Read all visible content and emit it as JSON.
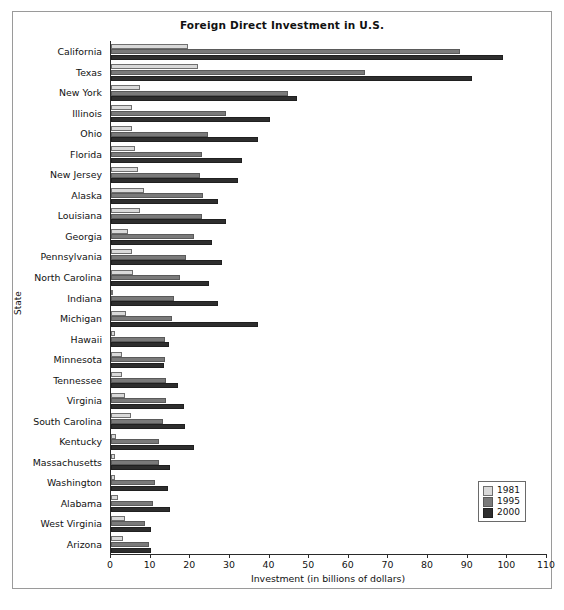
{
  "chart_data": {
    "type": "bar",
    "orientation": "horizontal",
    "title": "Foreign Direct Investment in U.S.",
    "xlabel": "Investment (in billions of dollars)",
    "ylabel": "State",
    "xlim": [
      0,
      110
    ],
    "xticks": [
      0,
      10,
      20,
      30,
      40,
      50,
      60,
      70,
      80,
      90,
      100,
      110
    ],
    "grid": false,
    "legend_position": "bottom-right",
    "categories": [
      "California",
      "Texas",
      "New York",
      "Illinois",
      "Ohio",
      "Florida",
      "New Jersey",
      "Alaska",
      "Louisiana",
      "Georgia",
      "Pennsylvania",
      "North Carolina",
      "Indiana",
      "Michigan",
      "Hawaii",
      "Minnesota",
      "Tennessee",
      "Virginia",
      "South Carolina",
      "Kentucky",
      "Massachusetts",
      "Washington",
      "Alabama",
      "West Virginia",
      "Arizona"
    ],
    "series": [
      {
        "name": "1981",
        "color": "#d9d9d9",
        "values": [
          19.5,
          22.0,
          7.3,
          5.3,
          5.3,
          6.0,
          6.8,
          8.4,
          7.4,
          4.2,
          5.4,
          5.5,
          0.3,
          3.8,
          1.0,
          2.8,
          2.8,
          3.5,
          5.0,
          1.3,
          1.0,
          1.0,
          1.7,
          3.5,
          3.0
        ]
      },
      {
        "name": "1995",
        "color": "#7a7a7a",
        "values": [
          88.0,
          64.0,
          44.7,
          29.0,
          24.5,
          23.0,
          22.5,
          23.3,
          23.0,
          21.0,
          19.0,
          17.4,
          15.8,
          15.5,
          13.5,
          13.6,
          14.0,
          14.0,
          13.0,
          12.0,
          12.0,
          11.0,
          10.5,
          8.5,
          9.5
        ]
      },
      {
        "name": "2000",
        "color": "#2e2e2e",
        "values": [
          99.0,
          91.0,
          47.0,
          40.0,
          37.0,
          33.0,
          32.0,
          27.0,
          29.0,
          25.5,
          28.0,
          24.8,
          27.0,
          37.0,
          14.7,
          13.3,
          17.0,
          18.4,
          18.7,
          21.0,
          15.0,
          14.5,
          15.0,
          10.0,
          10.0
        ]
      }
    ]
  },
  "legend": {
    "items": [
      {
        "label": "1981",
        "key": "y1981"
      },
      {
        "label": "1995",
        "key": "y1995"
      },
      {
        "label": "2000",
        "key": "y2000"
      }
    ]
  }
}
